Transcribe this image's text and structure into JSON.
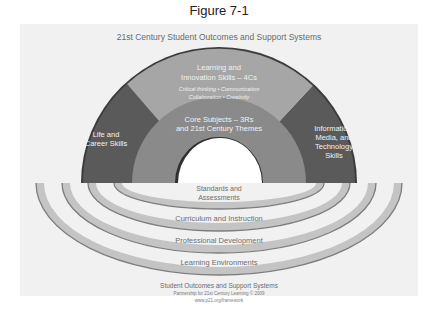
{
  "figure": {
    "caption": "Figure 7-1",
    "title": "21st Century Student Outcomes and Support Systems"
  },
  "arch": {
    "segments": [
      {
        "id": "life-career",
        "lines": [
          "Life and",
          "Career Skills"
        ],
        "color": "#5a5a5a"
      },
      {
        "id": "learning-innovation",
        "lines": [
          "Learning and",
          "Innovation Skills – 4Cs"
        ],
        "sublines": [
          "Critical thinking • Communication",
          "Collaboration • Creativity"
        ],
        "color": "#a6a6a6"
      },
      {
        "id": "info-media-tech",
        "lines": [
          "Information,",
          "Media, and",
          "Technology",
          "Skills"
        ],
        "color": "#5a5a5a"
      }
    ],
    "core": {
      "lines": [
        "Core Subjects – 3Rs",
        "and 21st Century Themes"
      ],
      "color": "#8a8a8a"
    }
  },
  "rings": [
    {
      "lines": [
        "Standards and",
        "Assessments"
      ]
    },
    {
      "lines": [
        "Curriculum and Instruction"
      ]
    },
    {
      "lines": [
        "Professional Development"
      ]
    },
    {
      "lines": [
        "Learning Environments"
      ]
    }
  ],
  "ring_color": "#c4c4c4",
  "ring_edge_color": "#7d7d7d",
  "footer": {
    "title": "Student Outcomes and Support Systems",
    "credit": "Partnership for 21st Century Learning © 2009",
    "url": "www.p21.org/framework"
  }
}
